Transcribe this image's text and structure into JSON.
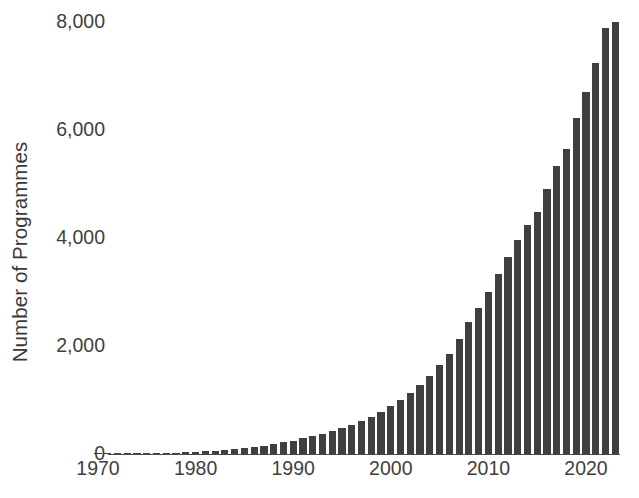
{
  "chart_data": {
    "type": "bar",
    "title": "",
    "subtitle": "",
    "xlabel": "",
    "ylabel": "Number of Programmes",
    "xlim": [
      1969,
      2024
    ],
    "ylim": [
      0,
      8200
    ],
    "grid": false,
    "legend": null,
    "bar_color": "#3f3f3f",
    "axis_color": "#4a4a4a",
    "text_color": "#3f3f3f",
    "y_ticks": [
      0,
      2000,
      4000,
      6000,
      8000
    ],
    "y_tick_labels": [
      "0",
      "2,000",
      "4,000",
      "6,000",
      "8,000"
    ],
    "x_ticks": [
      1970,
      1980,
      1990,
      2000,
      2010,
      2020
    ],
    "x_tick_labels": [
      "1970",
      "1980",
      "1990",
      "2000",
      "2010",
      "2020"
    ],
    "categories": [
      1970,
      1971,
      1972,
      1973,
      1974,
      1975,
      1976,
      1977,
      1978,
      1979,
      1980,
      1981,
      1982,
      1983,
      1984,
      1985,
      1986,
      1987,
      1988,
      1989,
      1990,
      1991,
      1992,
      1993,
      1994,
      1995,
      1996,
      1997,
      1998,
      1999,
      2000,
      2001,
      2002,
      2003,
      2004,
      2005,
      2006,
      2007,
      2008,
      2009,
      2010,
      2011,
      2012,
      2013,
      2014,
      2015,
      2016,
      2017,
      2018,
      2019,
      2020,
      2021,
      2022,
      2023
    ],
    "values": [
      5,
      6,
      8,
      10,
      12,
      15,
      18,
      22,
      26,
      32,
      40,
      50,
      62,
      75,
      90,
      110,
      130,
      155,
      185,
      215,
      250,
      290,
      330,
      375,
      425,
      480,
      540,
      610,
      690,
      780,
      880,
      1000,
      1130,
      1280,
      1450,
      1640,
      1860,
      2130,
      2450,
      2700,
      3000,
      3330,
      3650,
      3970,
      4250,
      4480,
      4900,
      5330,
      5650,
      6230,
      6700,
      7250,
      7880,
      8000
    ]
  }
}
